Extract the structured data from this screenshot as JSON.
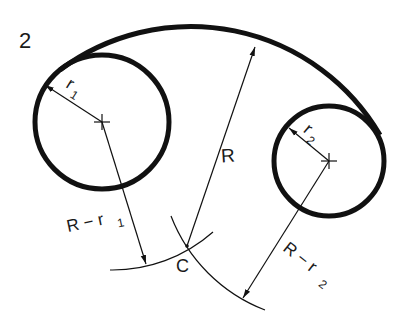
{
  "figure": {
    "number": "2"
  },
  "labels": {
    "r1": "r",
    "r1_sub": "1",
    "r2": "r",
    "r2_sub": "2",
    "R": "R",
    "R_minus_r1": "R − r",
    "R_minus_r1_sub": "1",
    "R_minus_r2": "R − r",
    "R_minus_r2_sub": "2",
    "center": "C"
  },
  "colors": {
    "stroke": "#111111",
    "background": "#ffffff"
  },
  "geometry": {
    "circle1": {
      "cx": 102,
      "cy": 122,
      "r": 67
    },
    "circle2": {
      "cx": 329,
      "cy": 161,
      "r": 55
    },
    "center_C": {
      "x": 187,
      "y": 246
    },
    "R": 219
  }
}
